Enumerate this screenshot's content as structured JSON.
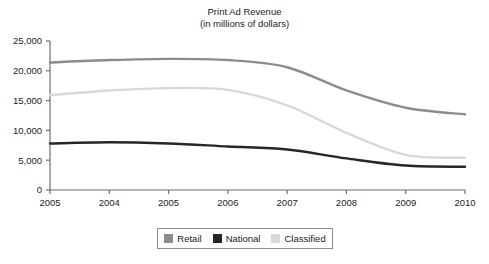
{
  "chart_data": {
    "type": "line",
    "title": "Print Ad Revenue",
    "subtitle": "(in millions of dollars)",
    "xlabel": "",
    "ylabel": "",
    "ylim": [
      0,
      25000
    ],
    "yticks": [
      0,
      5000,
      10000,
      15000,
      20000,
      25000
    ],
    "ytick_labels": [
      "0",
      "5,000",
      "10,000",
      "15,000",
      "20,000",
      "25,000"
    ],
    "categories": [
      "2005",
      "2004",
      "2005",
      "2006",
      "2007",
      "2008",
      "2009",
      "2010"
    ],
    "grid": false,
    "legend_position": "bottom",
    "series": [
      {
        "name": "Retail",
        "color": "#8c8c8c",
        "values": [
          21400,
          21800,
          22000,
          21800,
          20600,
          16700,
          13800,
          12700
        ]
      },
      {
        "name": "National",
        "color": "#262626",
        "values": [
          7800,
          8000,
          7800,
          7300,
          6800,
          5300,
          4100,
          3900
        ]
      },
      {
        "name": "Classified",
        "color": "#d8d8d8",
        "values": [
          15900,
          16700,
          17100,
          16800,
          14200,
          9600,
          5900,
          5400
        ]
      }
    ]
  },
  "legend": {
    "items": [
      {
        "label": "Retail",
        "color": "#8c8c8c"
      },
      {
        "label": "National",
        "color": "#262626"
      },
      {
        "label": "Classified",
        "color": "#d8d8d8"
      }
    ]
  },
  "axis": {
    "axis_color": "#6e6e6e"
  }
}
